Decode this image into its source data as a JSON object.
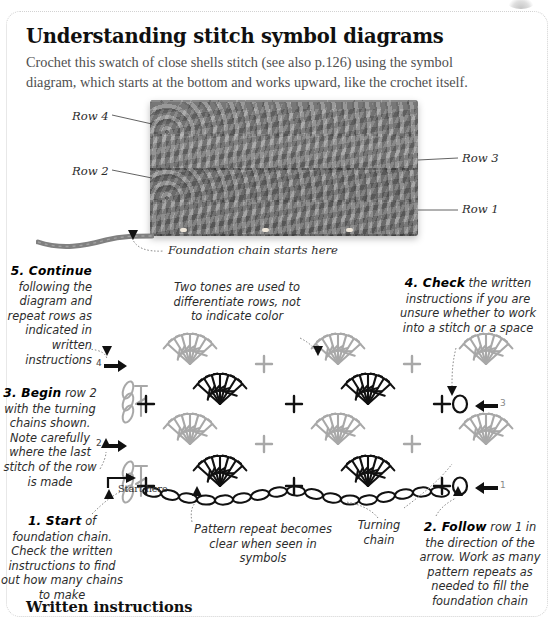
{
  "header": {
    "title": "Understanding stitch symbol diagrams",
    "intro": "Crochet this swatch of close shells stitch (see also p.126) using the symbol diagram, which starts at the bottom and works upward, like the crochet itself."
  },
  "photo": {
    "labels": [
      {
        "id": "row-4",
        "text": "Row 4"
      },
      {
        "id": "row-2",
        "text": "Row 2"
      },
      {
        "id": "row-3",
        "text": "Row 3"
      },
      {
        "id": "row-1",
        "text": "Row 1"
      },
      {
        "id": "foundation",
        "text": "Foundation chain starts here"
      }
    ]
  },
  "notes": {
    "step5": {
      "num": "5. Continue",
      "body": "following the diagram and repeat rows as indicated in written instructions"
    },
    "tones": {
      "body": "Two tones are used to differentiate rows, not to indicate color"
    },
    "step4": {
      "num": "4. Check",
      "body": "the written instructions if you are unsure whether to work into a stitch or a space"
    },
    "step3": {
      "num": "3. Begin",
      "body": "row 2 with the turning chains shown. Note carefully where the last stitch of the row is made"
    },
    "step1": {
      "num": "1. Start",
      "body": "of foundation chain. Check the written instructions to find out how many chains to make"
    },
    "repeat": {
      "body": "Pattern repeat becomes clear when seen in symbols"
    },
    "turning": {
      "body": "Turning chain"
    },
    "step2": {
      "num": "2. Follow",
      "body": "row 1 in the direction of the arrow. Work as many pattern repeats as needed to fill the foundation chain"
    },
    "start_here": "Start here"
  },
  "diagram": {
    "row_markers": [
      {
        "id": "row-4-marker",
        "label": "4",
        "direction": "right"
      },
      {
        "id": "row-3-marker",
        "label": "3",
        "direction": "left"
      },
      {
        "id": "row-2-marker",
        "label": "2",
        "direction": "right"
      },
      {
        "id": "row-1-marker",
        "label": "1",
        "direction": "left"
      }
    ],
    "end_symbols": [
      {
        "id": "row-3-end",
        "text": "+0"
      },
      {
        "id": "row-1-end",
        "text": "+0"
      }
    ]
  },
  "footer": {
    "written_instructions": "Written instructions"
  },
  "colors": {
    "ink_dark": "#111111",
    "ink_light": "#a8a8a8",
    "body_text": "#4f4f4f",
    "yarn": "#808080",
    "frame": "#d2d2d2"
  }
}
